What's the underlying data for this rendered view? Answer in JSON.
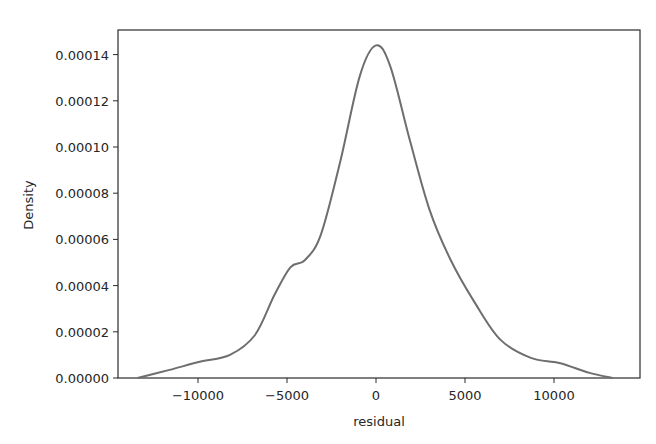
{
  "chart_data": {
    "type": "line",
    "subtype": "kde-density",
    "title": "",
    "xlabel": "residual",
    "ylabel": "Density",
    "xlim": [
      -14000,
      14000
    ],
    "ylim": [
      0,
      0.000152
    ],
    "x_ticks": [
      -10000,
      -5000,
      0,
      5000,
      10000
    ],
    "x_tick_labels": [
      "−10000",
      "−5000",
      "0",
      "5000",
      "10000"
    ],
    "y_ticks": [
      0,
      2e-05,
      4e-05,
      6e-05,
      8e-05,
      0.0001,
      0.00012,
      0.00014
    ],
    "y_tick_labels": [
      "0.00000",
      "0.00002",
      "0.00004",
      "0.00006",
      "0.00008",
      "0.00010",
      "0.00012",
      "0.00014"
    ],
    "grid": false,
    "legend": null,
    "line_color": "#6e6e6e",
    "series": [
      {
        "name": "residual density",
        "x": [
          -13400,
          -11600,
          -9900,
          -8200,
          -6800,
          -5700,
          -4800,
          -4000,
          -3100,
          -2000,
          -900,
          0,
          800,
          1900,
          3000,
          4200,
          5600,
          7000,
          8700,
          10300,
          12000,
          13300
        ],
        "y": [
          0.0,
          3.5e-06,
          7e-06,
          1e-05,
          1.86e-05,
          3.6e-05,
          4.8e-05,
          5.1e-05,
          6.2e-05,
          9.4e-05,
          0.000131,
          0.000144,
          0.000135,
          0.000103,
          7.3e-05,
          5.1e-05,
          3.2e-05,
          1.65e-05,
          8.7e-06,
          6.5e-06,
          2.2e-06,
          0.0
        ]
      }
    ]
  },
  "layout": {
    "plot_left": 118,
    "plot_right": 640,
    "plot_top": 30,
    "plot_bottom": 378,
    "x_zero_px": 376,
    "px_per_x_unit": 0.0178,
    "px_per_y_unit": 2310000
  }
}
